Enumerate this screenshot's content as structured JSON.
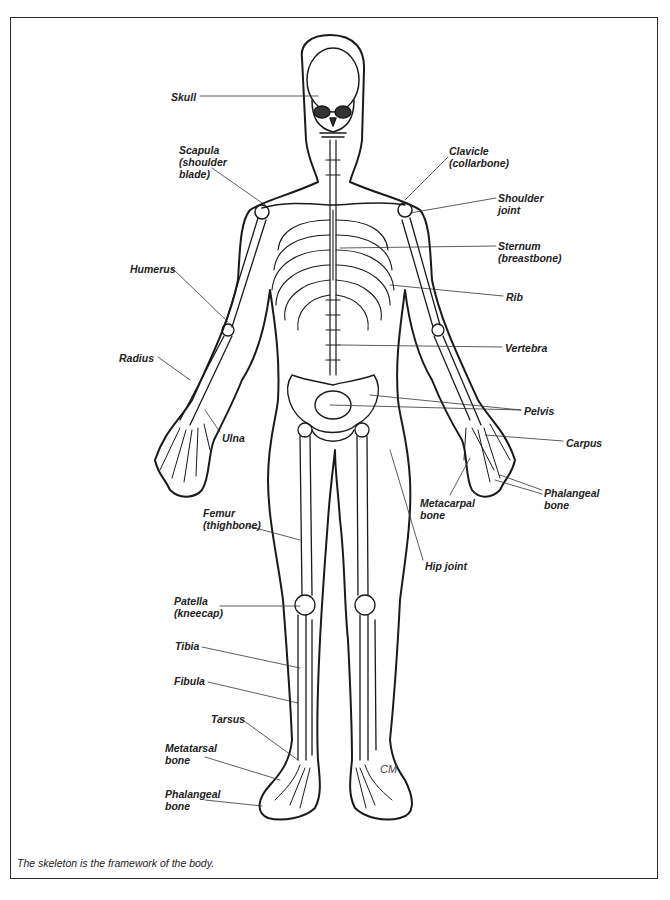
{
  "figure": {
    "caption": "The skeleton is the framework of the body.",
    "signature": "CM",
    "labels": [
      {
        "id": "skull",
        "text": "Skull",
        "x": 171,
        "y": 91
      },
      {
        "id": "scapula",
        "text": "Scapula\n(shoulder\nblade)",
        "x": 179,
        "y": 144
      },
      {
        "id": "clavicle",
        "text": "Clavicle\n(collarbone)",
        "x": 449,
        "y": 145
      },
      {
        "id": "shoulder-joint",
        "text": "Shoulder\njoint",
        "x": 498,
        "y": 192
      },
      {
        "id": "sternum",
        "text": "Sternum\n(breastbone)",
        "x": 498,
        "y": 240
      },
      {
        "id": "humerus",
        "text": "Humerus",
        "x": 130,
        "y": 263
      },
      {
        "id": "rib",
        "text": "Rib",
        "x": 506,
        "y": 291
      },
      {
        "id": "vertebra",
        "text": "Vertebra",
        "x": 505,
        "y": 342
      },
      {
        "id": "radius",
        "text": "Radius",
        "x": 119,
        "y": 352
      },
      {
        "id": "pelvis",
        "text": "Pelvis",
        "x": 524,
        "y": 405
      },
      {
        "id": "ulna",
        "text": "Ulna",
        "x": 222,
        "y": 432
      },
      {
        "id": "carpus",
        "text": "Carpus",
        "x": 566,
        "y": 437
      },
      {
        "id": "phalangeal-hand",
        "text": "Phalangeal\nbone",
        "x": 544,
        "y": 487
      },
      {
        "id": "metacarpal",
        "text": "Metacarpal\nbone",
        "x": 420,
        "y": 497
      },
      {
        "id": "femur",
        "text": "Femur\n(thighbone)",
        "x": 203,
        "y": 507
      },
      {
        "id": "hip-joint",
        "text": "Hip joint",
        "x": 425,
        "y": 560
      },
      {
        "id": "patella",
        "text": "Patella\n(kneecap)",
        "x": 174,
        "y": 595
      },
      {
        "id": "tibia",
        "text": "Tibia",
        "x": 175,
        "y": 640
      },
      {
        "id": "fibula",
        "text": "Fibula",
        "x": 174,
        "y": 675
      },
      {
        "id": "tarsus",
        "text": "Tarsus",
        "x": 211,
        "y": 713
      },
      {
        "id": "metatarsal",
        "text": "Metatarsal\nbone",
        "x": 165,
        "y": 742
      },
      {
        "id": "phalangeal-foot",
        "text": "Phalangeal\nbone",
        "x": 165,
        "y": 788
      }
    ]
  }
}
